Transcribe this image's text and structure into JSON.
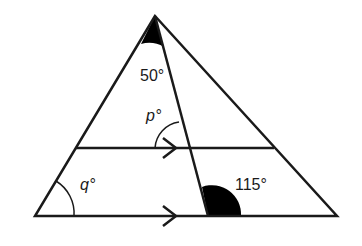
{
  "diagram": {
    "type": "geometry-triangle",
    "angles": {
      "apex": "50°",
      "p": "p°",
      "q": "q°",
      "bottom": "115°"
    },
    "colors": {
      "line": "#1a1a1a",
      "shade": "#000000",
      "background": "#ffffff"
    }
  }
}
